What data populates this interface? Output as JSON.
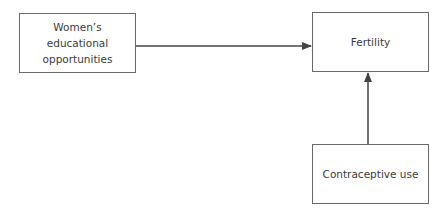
{
  "diagram": {
    "nodes": [
      {
        "id": "education",
        "label": "Women’s\neducational\nopportunities"
      },
      {
        "id": "fertility",
        "label": "Fertility"
      },
      {
        "id": "contraception",
        "label": "Contraceptive use"
      }
    ],
    "edges": [
      {
        "from": "education",
        "to": "fertility"
      },
      {
        "from": "contraception",
        "to": "fertility"
      }
    ],
    "colors": {
      "line": "#444444",
      "border": "#6a6a6a"
    }
  }
}
